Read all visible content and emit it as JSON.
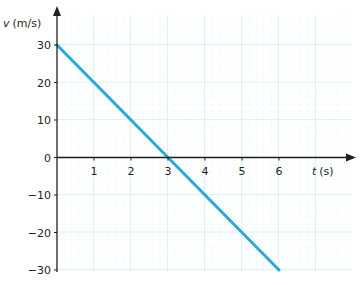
{
  "chart_data": {
    "type": "line",
    "title": "",
    "xlabel": "t (s)",
    "ylabel": "v (m/s)",
    "xlabel_var": "t",
    "xlabel_unit": "(s)",
    "ylabel_var": "v",
    "ylabel_unit": "(m/s)",
    "x_ticks": [
      "1",
      "2",
      "3",
      "4",
      "5",
      "6"
    ],
    "y_ticks": [
      "30",
      "20",
      "10",
      "0",
      "−10",
      "−20",
      "−30"
    ],
    "xlim": [
      0,
      7.8
    ],
    "ylim": [
      -30,
      30
    ],
    "grid": true,
    "legend": null,
    "series": [
      {
        "name": "velocity",
        "color": "#29a8e0",
        "x": [
          0,
          3,
          6
        ],
        "y": [
          30,
          0,
          -30
        ]
      }
    ]
  },
  "colors": {
    "grid_minor": "#dff3f5",
    "grid_major": "#c5e8ec",
    "axis": "#231f20",
    "line": "#29a8e0"
  }
}
